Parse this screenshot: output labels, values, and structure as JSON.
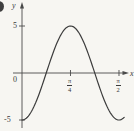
{
  "figure": {
    "y_axis_label": "y",
    "x_axis_label": "x",
    "origin_label": "0",
    "y_ticks": [
      {
        "label": "5",
        "value": 5
      },
      {
        "label": "-5",
        "value": -5
      }
    ],
    "x_ticks": [
      {
        "numerator": "π",
        "denominator": "4",
        "value": 0.7853981633974483
      },
      {
        "numerator": "π",
        "denominator": "2",
        "value": 1.5707963267948966
      }
    ]
  },
  "chart_data": {
    "type": "line",
    "title": "",
    "xlabel": "x",
    "ylabel": "y",
    "function": "y = -5 cos 4x",
    "amplitude": -5,
    "frequency": 4,
    "x_range_radians": [
      0,
      1.655
    ],
    "ylim": [
      -5,
      5
    ],
    "x_tick_values": [
      0.7853981633974483,
      1.5707963267948966
    ],
    "x_tick_labels": [
      "π/4",
      "π/2"
    ],
    "y_tick_values": [
      5,
      -5
    ],
    "y_tick_labels": [
      "5",
      "-5"
    ],
    "key_points": [
      {
        "x": "0",
        "y": -5
      },
      {
        "x": "π/8",
        "y": 0
      },
      {
        "x": "π/4",
        "y": 5
      },
      {
        "x": "3π/8",
        "y": 0
      },
      {
        "x": "π/2",
        "y": -5
      }
    ],
    "grid": false,
    "legend": false
  },
  "colors": {
    "curve": "#3c3c3c",
    "axis": "#4a4a4a",
    "text": "#3a3a3a",
    "background": "#f7f6f2"
  }
}
